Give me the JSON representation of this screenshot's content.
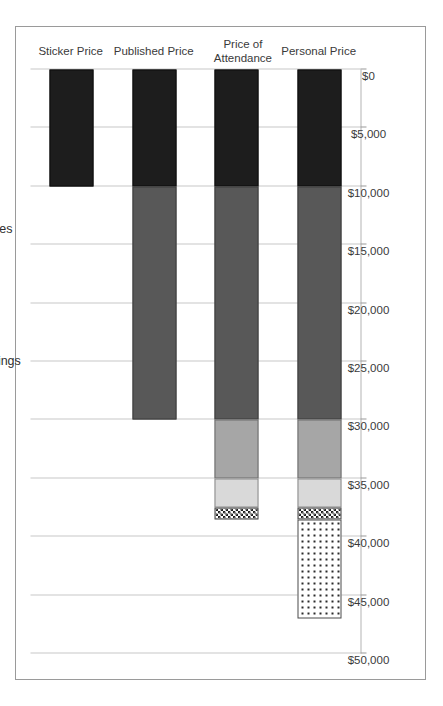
{
  "chart_data": {
    "type": "bar",
    "orientation": "horizontal-rotated",
    "title": "",
    "xlabel": "",
    "ylabel": "",
    "stacked": true,
    "grid": true,
    "legend_position": "right",
    "categories": [
      "Sticker Price",
      "Published Price",
      "Price of\nAttendance",
      "Personal Price"
    ],
    "category_labels_flat": [
      "Sticker Price",
      "Published Price",
      "Price of Attendance",
      "Personal Price"
    ],
    "value_axis": {
      "min": 0,
      "max": 50000,
      "step": 5000,
      "tick_labels": [
        "$50,000",
        "$45,000",
        "$40,000",
        "$35,000",
        "$30,000",
        "$25,000",
        "$20,000",
        "$15,000",
        "$10,000",
        "$5,000",
        "$0"
      ],
      "tick_values": [
        50000,
        45000,
        40000,
        35000,
        30000,
        25000,
        20000,
        15000,
        10000,
        5000,
        0
      ],
      "direction": "descending-left-to-right"
    },
    "series": [
      {
        "name": "Tuition & Fees",
        "pattern": "solid-black",
        "color": "#1d1d1d",
        "values": [
          10000,
          10000,
          10000,
          10000
        ]
      },
      {
        "name": "Room & Board",
        "pattern": "solid-dark-gray",
        "color": "#585858",
        "values": [
          0,
          20000,
          20000,
          20000
        ]
      },
      {
        "name": "Books & Supplies",
        "pattern": "solid-mid-gray",
        "color": "#a6a6a6",
        "values": [
          0,
          0,
          5000,
          5000
        ]
      },
      {
        "name": "Transportation",
        "pattern": "solid-light-gray",
        "color": "#d9d9d9",
        "values": [
          0,
          0,
          2500,
          2500
        ]
      },
      {
        "name": "Other",
        "pattern": "checkerboard",
        "color": "#ffffff",
        "values": [
          0,
          0,
          1000,
          1000
        ]
      },
      {
        "name": "Foregone Earnings",
        "pattern": "dotted",
        "color": "#ffffff",
        "values": [
          0,
          0,
          0,
          8500
        ]
      }
    ],
    "totals": [
      10000,
      30000,
      38500,
      47000
    ],
    "legend_entries": [
      "Foregone Earnings",
      "Other",
      "Transportation",
      "Books & Supplies",
      "Room & Board",
      "Tuition & Fees"
    ]
  },
  "caption": "",
  "colors": {
    "tuition": "#1d1d1d",
    "room_board": "#585858",
    "books": "#a6a6a6",
    "transportation": "#d9d9d9",
    "other": "#ffffff",
    "foregone": "#ffffff",
    "gridline": "#c8c8c8",
    "axis": "#b4b4b4",
    "frame": "#9a9a9a",
    "text": "#3a3a3a"
  }
}
